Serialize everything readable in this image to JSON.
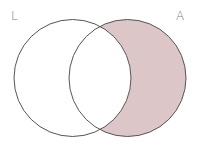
{
  "diagram": {
    "type": "venn",
    "sets": [
      {
        "label": "L",
        "cx": 72.5,
        "cy": 78,
        "r": 58.5
      },
      {
        "label": "A",
        "cx": 127.5,
        "cy": 78,
        "r": 58.5
      }
    ],
    "shaded_region": "A minus L",
    "colors": {
      "shade": "#dcc6c8",
      "stroke": "#555555",
      "label": "#777777"
    }
  }
}
